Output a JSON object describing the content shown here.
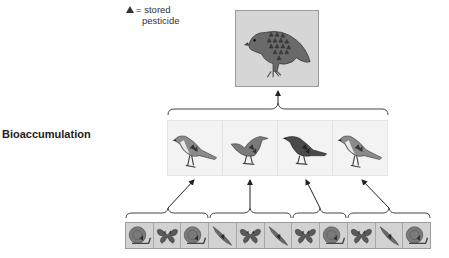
{
  "legend": {
    "symbol": "▲",
    "equals": "=",
    "line1": "stored",
    "line2": "pesticide"
  },
  "title": "Bioaccumulation",
  "levels": {
    "top_predator": {
      "icon": "hawk-icon",
      "pesticide_units": 15
    },
    "secondary_consumers": [
      {
        "icon": "mockingbird-icon",
        "pesticide_units": 4
      },
      {
        "icon": "songbird-icon",
        "pesticide_units": 3
      },
      {
        "icon": "dark-bird-icon",
        "pesticide_units": 3
      },
      {
        "icon": "mockingbird-icon",
        "pesticide_units": 4
      }
    ],
    "primary_consumers": [
      {
        "icon": "snail-icon",
        "group": 0
      },
      {
        "icon": "butterfly-icon",
        "group": 0
      },
      {
        "icon": "snail-icon",
        "group": 0
      },
      {
        "icon": "slug-icon",
        "group": 1
      },
      {
        "icon": "butterfly-icon",
        "group": 1
      },
      {
        "icon": "slug-icon",
        "group": 1
      },
      {
        "icon": "butterfly-icon",
        "group": 2
      },
      {
        "icon": "snail-icon",
        "group": 2
      },
      {
        "icon": "butterfly-icon",
        "group": 3
      },
      {
        "icon": "slug-icon",
        "group": 3
      },
      {
        "icon": "snail-icon",
        "group": 3
      }
    ]
  },
  "colors": {
    "box_fill": "#d6d6d6",
    "bird_row_fill": "#f3f3f3",
    "line": "#444444"
  }
}
